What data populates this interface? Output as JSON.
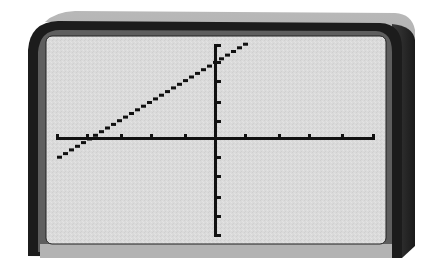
{
  "device": {
    "type": "graphing-calculator-screen",
    "colors": {
      "bezel_top": "#a8a8a8",
      "bezel_outer": "#1c1c1c",
      "bezel_inner": "#5a5a5a",
      "screen": "#d9d9d9",
      "screen_bottom_ledge": "#b0b0b0",
      "side_shadow": "#2a2a2a",
      "ink": "#111111"
    }
  },
  "chart_data": {
    "type": "line",
    "title": "",
    "xlabel": "",
    "ylabel": "",
    "xlim": [
      -5,
      5
    ],
    "ylim": [
      -5,
      5
    ],
    "xscl": 1,
    "yscl": 1,
    "grid": false,
    "axes": true,
    "equation": "y = x + 4",
    "series": [
      {
        "name": "Y1",
        "x": [
          -5,
          1
        ],
        "y": [
          -1,
          5
        ]
      }
    ],
    "x_intercept": -4,
    "y_intercept": 4
  }
}
